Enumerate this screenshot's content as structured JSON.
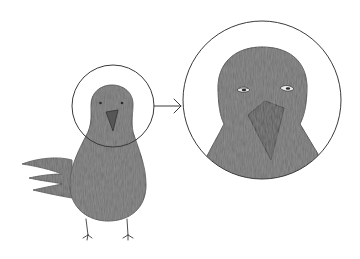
{
  "illustration": {
    "subject": "crow",
    "description": "Hand-drawn gray crow with a circle around its head; an arrow points to an enlarged circular close-up of the crow's head",
    "colors": {
      "background": "#ffffff",
      "outline": "#3a3a3a",
      "body_fill": "#6f6f6f",
      "beak_fill": "#565656",
      "eye_white": "#e8e8e8"
    },
    "elements": {
      "small_bird": {
        "label": "full-body crow"
      },
      "focus_circle": {
        "label": "head highlight circle"
      },
      "arrow": {
        "label": "zoom arrow"
      },
      "zoom_circle": {
        "label": "enlarged head close-up"
      }
    }
  }
}
